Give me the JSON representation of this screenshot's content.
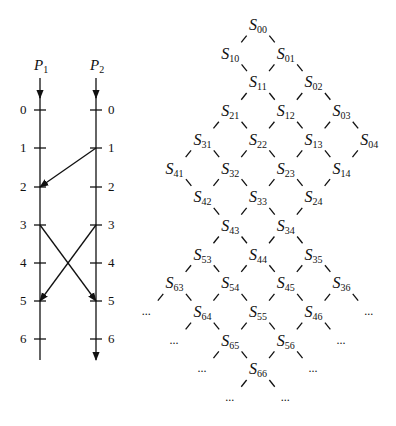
{
  "space_time_diagram": {
    "processes": [
      {
        "label": "P",
        "sub": "1",
        "x": 40,
        "arrow_bottom": false
      },
      {
        "label": "P",
        "sub": "2",
        "x": 96,
        "arrow_bottom": true
      }
    ],
    "ticks": [
      "0",
      "1",
      "2",
      "3",
      "4",
      "5",
      "6"
    ],
    "tick_y": [
      110,
      148,
      187,
      225,
      263,
      301,
      339
    ],
    "messages": [
      {
        "from": {
          "proc": 2,
          "tick": 1
        },
        "to": {
          "proc": 1,
          "tick": 2
        }
      },
      {
        "from": {
          "proc": 1,
          "tick": 3
        },
        "to": {
          "proc": 2,
          "tick": 5
        }
      },
      {
        "from": {
          "proc": 2,
          "tick": 3
        },
        "to": {
          "proc": 1,
          "tick": 5
        }
      }
    ]
  },
  "lattice": {
    "node_prefix": "S",
    "ellipsis": "...",
    "nodes": [
      "00",
      "10",
      "01",
      "11",
      "02",
      "21",
      "12",
      "03",
      "31",
      "22",
      "13",
      "04",
      "41",
      "32",
      "23",
      "14",
      "42",
      "33",
      "24",
      "43",
      "34",
      "53",
      "44",
      "35",
      "63",
      "54",
      "45",
      "36",
      "64",
      "55",
      "46",
      "65",
      "56",
      "66"
    ],
    "edges": [
      [
        "00",
        "10"
      ],
      [
        "00",
        "01"
      ],
      [
        "10",
        "11"
      ],
      [
        "01",
        "11"
      ],
      [
        "01",
        "02"
      ],
      [
        "11",
        "21"
      ],
      [
        "11",
        "12"
      ],
      [
        "02",
        "12"
      ],
      [
        "02",
        "03"
      ],
      [
        "21",
        "31"
      ],
      [
        "21",
        "22"
      ],
      [
        "12",
        "22"
      ],
      [
        "12",
        "13"
      ],
      [
        "03",
        "13"
      ],
      [
        "03",
        "04"
      ],
      [
        "31",
        "41"
      ],
      [
        "31",
        "32"
      ],
      [
        "22",
        "32"
      ],
      [
        "22",
        "23"
      ],
      [
        "13",
        "23"
      ],
      [
        "13",
        "14"
      ],
      [
        "04",
        "14"
      ],
      [
        "41",
        "42"
      ],
      [
        "32",
        "42"
      ],
      [
        "32",
        "33"
      ],
      [
        "23",
        "33"
      ],
      [
        "23",
        "24"
      ],
      [
        "14",
        "24"
      ],
      [
        "42",
        "43"
      ],
      [
        "33",
        "43"
      ],
      [
        "33",
        "34"
      ],
      [
        "24",
        "34"
      ],
      [
        "43",
        "53"
      ],
      [
        "43",
        "44"
      ],
      [
        "34",
        "44"
      ],
      [
        "34",
        "35"
      ],
      [
        "53",
        "63"
      ],
      [
        "53",
        "54"
      ],
      [
        "44",
        "54"
      ],
      [
        "44",
        "45"
      ],
      [
        "35",
        "45"
      ],
      [
        "35",
        "36"
      ],
      [
        "63",
        "64"
      ],
      [
        "54",
        "64"
      ],
      [
        "54",
        "55"
      ],
      [
        "45",
        "55"
      ],
      [
        "45",
        "46"
      ],
      [
        "36",
        "46"
      ],
      [
        "64",
        "65"
      ],
      [
        "55",
        "65"
      ],
      [
        "55",
        "56"
      ],
      [
        "46",
        "56"
      ],
      [
        "65",
        "66"
      ],
      [
        "56",
        "66"
      ]
    ],
    "open_ends": [
      [
        "63",
        "left"
      ],
      [
        "36",
        "right"
      ],
      [
        "64",
        "left"
      ],
      [
        "46",
        "right"
      ],
      [
        "65",
        "left"
      ],
      [
        "56",
        "right"
      ],
      [
        "66",
        "left"
      ],
      [
        "66",
        "right"
      ]
    ]
  }
}
